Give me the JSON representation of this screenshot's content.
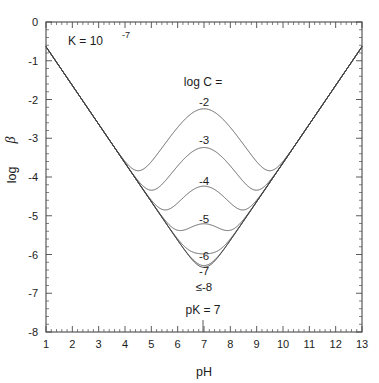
{
  "figure": {
    "name": "buffer-intensity-vs-ph",
    "annotations": {
      "equilibrium_constant": "K = 10",
      "equilibrium_constant_exponent": "-7",
      "pk_marker": "pK = 7",
      "series_legend_title": "log C ="
    }
  },
  "axes": {
    "x": {
      "label": "pH",
      "min": 1,
      "max": 13,
      "ticks": [
        "1",
        "2",
        "3",
        "4",
        "5",
        "6",
        "7",
        "8",
        "9",
        "10",
        "11",
        "12",
        "13"
      ],
      "minor_per_interval": 5
    },
    "y": {
      "label_prefix": "log",
      "label_symbol": "β",
      "min": -8,
      "max": 0,
      "ticks": [
        "0",
        "-1",
        "-2",
        "-3",
        "-4",
        "-5",
        "-6",
        "-7",
        "-8"
      ],
      "minor_per_interval": 5
    }
  },
  "chart_data": {
    "type": "line",
    "title": "",
    "subtitle": "",
    "xlabel": "pH",
    "ylabel": "log β",
    "xlim": [
      1,
      13
    ],
    "ylim": [
      -8,
      0
    ],
    "grid": false,
    "legend_position": "inline-curve-labels",
    "annotations": [
      {
        "text": "K = 10^-7",
        "x": 2.4,
        "y": -0.55
      },
      {
        "text": "log C =",
        "x": 6.95,
        "y": -1.62
      },
      {
        "text": "pK = 7",
        "x": 7.0,
        "y": -7.35
      }
    ],
    "pK": 7,
    "K": 1e-07,
    "model": "log_beta = log10( 2.303 * ( Cw*Ka*H/(Ka+H)^2 + Kw/H + H ) )",
    "Kw": 1e-14,
    "series": [
      {
        "name": "-2",
        "log_C": -2,
        "label": "-2",
        "label_x": 7.0,
        "label_y": -2.07,
        "minimum_logbeta": -3.78,
        "minimum_pH": [
          5.05,
          8.95
        ],
        "peak_at_pK_logbeta": -2.66
      },
      {
        "name": "-3",
        "log_C": -3,
        "label": "-3",
        "label_x": 7.0,
        "label_y": -3.05,
        "minimum_logbeta": -4.3,
        "minimum_pH": [
          5.5,
          8.5
        ],
        "peak_at_pK_logbeta": -3.66
      },
      {
        "name": "-4",
        "log_C": -4,
        "label": "-4",
        "label_x": 7.0,
        "label_y": -4.1,
        "minimum_logbeta": -4.85,
        "minimum_pH": [
          5.9,
          8.1
        ],
        "peak_at_pK_logbeta": -4.66
      },
      {
        "name": "-5",
        "log_C": -5,
        "label": "-5",
        "label_x": 7.0,
        "label_y": -5.08,
        "minimum_logbeta": -5.55,
        "minimum_pH": [
          6.3,
          7.7
        ],
        "peak_at_pK_logbeta": -5.66
      },
      {
        "name": "-6",
        "log_C": -6,
        "label": "-6",
        "label_x": 7.0,
        "label_y": -6.03,
        "minimum_logbeta": -6.42,
        "minimum_pH": [
          6.6,
          7.4
        ],
        "peak_at_pK_logbeta": -6.66
      },
      {
        "name": "-7",
        "log_C": -7,
        "label": "-7",
        "label_x": 7.0,
        "label_y": -6.43,
        "minimum_logbeta": -6.85,
        "minimum_pH": [
          6.8,
          7.2
        ],
        "peak_at_pK_logbeta": -7.4
      },
      {
        "name": "le-8",
        "log_C": -8,
        "label": "≤-8",
        "label_x": 7.0,
        "label_y": -6.85,
        "minimum_logbeta": -7.0,
        "minimum_pH": [
          7.0
        ],
        "peak_at_pK_logbeta": -7.66,
        "is_asymptote": true
      }
    ]
  }
}
